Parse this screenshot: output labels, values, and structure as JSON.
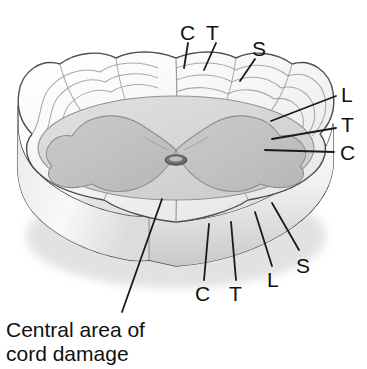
{
  "figure": {
    "caption": {
      "line1": "Central area of",
      "line2": "cord damage",
      "full": "Central area of cord damage"
    },
    "labels": {
      "top": [
        {
          "id": "top-c",
          "text": "C",
          "x": 180,
          "y": 22,
          "leader": {
            "x1": 188,
            "y1": 43,
            "x2": 184,
            "y2": 66
          }
        },
        {
          "id": "top-t",
          "text": "T",
          "x": 205,
          "y": 22,
          "leader": {
            "x1": 216,
            "y1": 43,
            "x2": 205,
            "y2": 67
          }
        },
        {
          "id": "top-s",
          "text": "S",
          "x": 252,
          "y": 38,
          "leader": {
            "x1": 255,
            "y1": 59,
            "x2": 241,
            "y2": 80
          }
        }
      ],
      "right": [
        {
          "id": "right-l",
          "text": "L",
          "x": 341,
          "y": 84,
          "leader": {
            "x1": 336,
            "y1": 96,
            "x2": 271,
            "y2": 121
          }
        },
        {
          "id": "right-t",
          "text": "T",
          "x": 341,
          "y": 114,
          "leader": {
            "x1": 336,
            "y1": 128,
            "x2": 273,
            "y2": 138
          }
        },
        {
          "id": "right-c",
          "text": "C",
          "x": 341,
          "y": 142,
          "leader": {
            "x1": 334,
            "y1": 152,
            "x2": 266,
            "y2": 150
          }
        }
      ],
      "bottom": [
        {
          "id": "bottom-c",
          "text": "C",
          "x": 195,
          "y": 285,
          "leader": {
            "x1": 204,
            "y1": 283,
            "x2": 208,
            "y2": 224
          }
        },
        {
          "id": "bottom-t",
          "text": "T",
          "x": 228,
          "y": 285,
          "leader": {
            "x1": 236,
            "y1": 283,
            "x2": 231,
            "y2": 222
          }
        },
        {
          "id": "bottom-l",
          "text": "L",
          "x": 266,
          "y": 272,
          "leader": {
            "x1": 272,
            "y1": 268,
            "x2": 255,
            "y2": 213
          }
        },
        {
          "id": "bottom-s",
          "text": "S",
          "x": 296,
          "y": 258,
          "leader": {
            "x1": 299,
            "y1": 252,
            "x2": 272,
            "y2": 203
          }
        }
      ],
      "caption_leader": {
        "x1": 122,
        "y1": 310,
        "x2": 161,
        "y2": 200
      }
    },
    "legend_keys": [
      {
        "key": "C",
        "meaning": "Cervical"
      },
      {
        "key": "T",
        "meaning": "Thoracic"
      },
      {
        "key": "L",
        "meaning": "Lumbar"
      },
      {
        "key": "S",
        "meaning": "Sacral"
      }
    ],
    "colors": {
      "background": "#ffffff",
      "outline": "#3a3a3a",
      "top_surface": "#f2f2f2",
      "top_surface_shadow": "#e3e3e3",
      "gray_matter_disc": "#d6d6d6",
      "gray_matter_butterfly": "#c2c2c2",
      "central_canal": "#6e6e6e",
      "side_wall_light": "#fafafa",
      "side_wall_dark": "#c9c9c9",
      "label_text": "#111111",
      "leader_line": "#1a1a1a"
    }
  }
}
